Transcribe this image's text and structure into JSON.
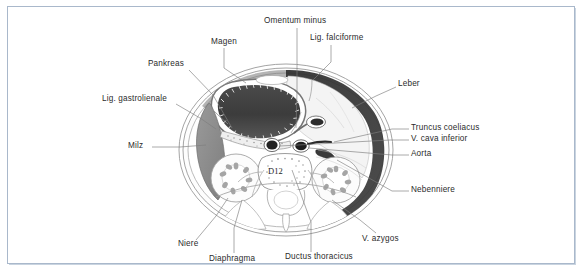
{
  "figure": {
    "title_level": "D12",
    "vertebra_label": "D12",
    "caption": "",
    "frame_color": "#a9b8cb",
    "background": "#ffffff"
  },
  "labels": [
    {
      "id": "omentum-minus",
      "text": "Omentum minus",
      "x": 264,
      "y": 20,
      "align": "left"
    },
    {
      "id": "lig-falciforme",
      "text": "Lig. falciforme",
      "x": 310,
      "y": 37,
      "align": "left"
    },
    {
      "id": "magen",
      "text": "Magen",
      "x": 211,
      "y": 41,
      "align": "left"
    },
    {
      "id": "pankreas",
      "text": "Pankreas",
      "x": 148,
      "y": 63,
      "align": "left"
    },
    {
      "id": "leber",
      "text": "Leber",
      "x": 398,
      "y": 83,
      "align": "left"
    },
    {
      "id": "lig-gastrolienale",
      "text": "Lig. gastrolienale",
      "x": 102,
      "y": 98,
      "align": "left"
    },
    {
      "id": "truncus-coeliacus",
      "text": "Truncus coeliacus",
      "x": 411,
      "y": 127,
      "align": "left"
    },
    {
      "id": "v-cava-inferior",
      "text": "V. cava inferior",
      "x": 411,
      "y": 138,
      "align": "left"
    },
    {
      "id": "milz",
      "text": "Milz",
      "x": 128,
      "y": 145,
      "align": "left"
    },
    {
      "id": "aorta",
      "text": "Aorta",
      "x": 411,
      "y": 153,
      "align": "left"
    },
    {
      "id": "nebenniere",
      "text": "Nebenniere",
      "x": 411,
      "y": 189,
      "align": "left"
    },
    {
      "id": "v-azygos",
      "text": "V. azygos",
      "x": 362,
      "y": 238,
      "align": "left"
    },
    {
      "id": "niere",
      "text": "Niere",
      "x": 178,
      "y": 243,
      "align": "left"
    },
    {
      "id": "ductus-thoracicus",
      "text": "Ductus thoracicus",
      "x": 285,
      "y": 256,
      "align": "left"
    },
    {
      "id": "diaphragma",
      "text": "Diaphragma",
      "x": 209,
      "y": 258,
      "align": "left"
    }
  ],
  "anatomy_structures": [
    {
      "id": "stomach",
      "name": "Magen (stomach)",
      "tone": "#3a3a3a"
    },
    {
      "id": "spleen",
      "name": "Milz (spleen)",
      "tone": "#8c8c8c"
    },
    {
      "id": "liver",
      "name": "Leber (liver)",
      "tone": "#f2f2f2"
    },
    {
      "id": "kidney-left",
      "name": "Niere links",
      "tone": "#fbfbfb"
    },
    {
      "id": "kidney-right",
      "name": "Niere rechts",
      "tone": "#fbfbfb"
    },
    {
      "id": "vertebra",
      "name": "Wirbelkörper D12",
      "tone": "#ffffff"
    },
    {
      "id": "aorta",
      "name": "Aorta",
      "tone": "#1a1a1a"
    },
    {
      "id": "vena-cava",
      "name": "V. cava inferior",
      "tone": "#1a1a1a"
    },
    {
      "id": "body-wall",
      "name": "Bauchwand / Zwerchfell",
      "tone": "#2e2e2e"
    }
  ]
}
